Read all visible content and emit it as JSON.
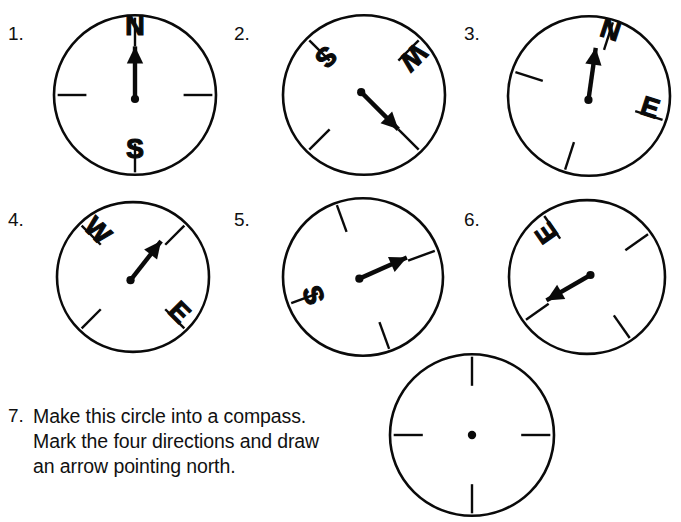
{
  "page": {
    "background_color": "#ffffff",
    "ink_color": "#0a0a0a",
    "width": 681,
    "height": 522
  },
  "items": [
    {
      "number": "1.",
      "number_pos": {
        "x": 8,
        "y": 24
      },
      "compass": {
        "cx": 135,
        "cy": 95,
        "r": 81,
        "rotation_deg": 0,
        "arrow_angle_deg": 0,
        "labels": [
          {
            "text": "N",
            "direction": "north"
          },
          {
            "text": "S",
            "direction": "south"
          }
        ],
        "ticks": [
          "north",
          "east",
          "south",
          "west"
        ],
        "has_arrow": true,
        "has_center_dot": true
      }
    },
    {
      "number": "2.",
      "number_pos": {
        "x": 234,
        "y": 24
      },
      "compass": {
        "cx": 364,
        "cy": 95,
        "r": 81,
        "rotation_deg": 135,
        "arrow_angle_deg": 135,
        "labels": [
          {
            "text": "S",
            "direction": "south"
          },
          {
            "text": "W",
            "direction": "west"
          }
        ],
        "ticks": [
          "north",
          "east",
          "south",
          "west"
        ],
        "has_arrow": true,
        "has_center_dot": true
      }
    },
    {
      "number": "3.",
      "number_pos": {
        "x": 464,
        "y": 24
      },
      "compass": {
        "cx": 589,
        "cy": 96,
        "r": 81,
        "rotation_deg": 18,
        "arrow_angle_deg": 8,
        "labels": [
          {
            "text": "N",
            "direction": "north"
          },
          {
            "text": "E",
            "direction": "east"
          }
        ],
        "ticks": [
          "north",
          "east",
          "south",
          "west"
        ],
        "has_arrow": true,
        "has_center_dot": true
      }
    },
    {
      "number": "4.",
      "number_pos": {
        "x": 8,
        "y": 210
      },
      "compass": {
        "cx": 133,
        "cy": 277,
        "r": 76,
        "rotation_deg": 45,
        "arrow_angle_deg": 38,
        "labels": [
          {
            "text": "W",
            "direction": "west"
          },
          {
            "text": "E",
            "direction": "east"
          }
        ],
        "ticks": [
          "north",
          "east",
          "south",
          "west"
        ],
        "has_arrow": true,
        "has_center_dot": true
      }
    },
    {
      "number": "5.",
      "number_pos": {
        "x": 234,
        "y": 210
      },
      "compass": {
        "cx": 363,
        "cy": 277,
        "r": 80,
        "rotation_deg": 70,
        "arrow_angle_deg": 66,
        "labels": [
          {
            "text": "S",
            "direction": "south"
          }
        ],
        "ticks": [
          "north",
          "east",
          "south",
          "west"
        ],
        "has_arrow": true,
        "has_center_dot": true
      }
    },
    {
      "number": "6.",
      "number_pos": {
        "x": 464,
        "y": 210
      },
      "compass": {
        "cx": 587,
        "cy": 277,
        "r": 78,
        "rotation_deg": 235,
        "arrow_angle_deg": 240,
        "labels": [
          {
            "text": "E",
            "direction": "east"
          }
        ],
        "ticks": [
          "north",
          "east",
          "south",
          "west"
        ],
        "has_arrow": true,
        "has_center_dot": true
      }
    },
    {
      "number": "7.",
      "number_pos": {
        "x": 8,
        "y": 406
      },
      "instructions": "Make this circle into a compass.\nMark the four directions and draw\nan arrow pointing north.",
      "instructions_pos": {
        "x": 33,
        "y": 404
      },
      "compass": {
        "cx": 472,
        "cy": 435,
        "r": 82,
        "rotation_deg": 0,
        "arrow_angle_deg": null,
        "labels": [],
        "ticks": [
          "north",
          "east",
          "south",
          "west"
        ],
        "has_arrow": false,
        "has_center_dot": true
      }
    }
  ]
}
